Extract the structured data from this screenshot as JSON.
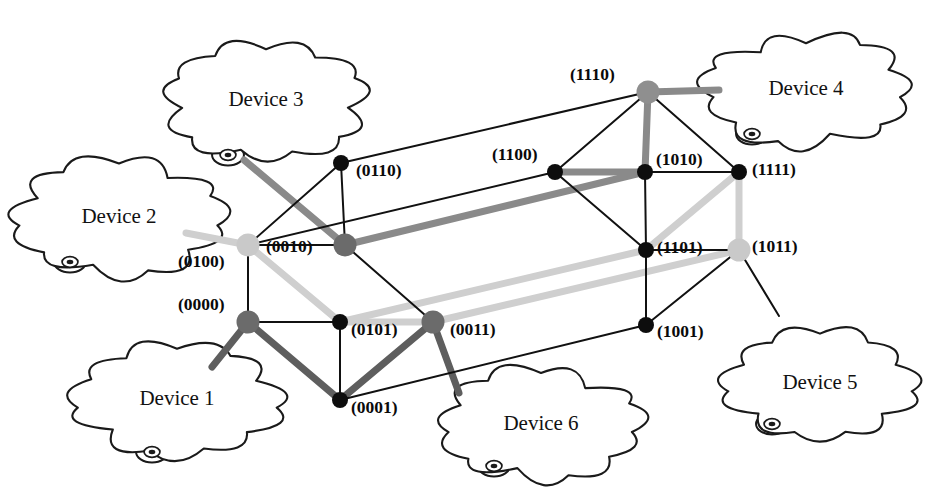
{
  "figure": {
    "width": 929,
    "height": 504,
    "background": "#ffffff"
  },
  "palette": {
    "thin_black": "#111111",
    "dark_gray": "#5e5e5e",
    "mid_gray": "#8a8a8a",
    "light_gray": "#cfcfcf",
    "node_black": "#0d0d0d",
    "text": "#0a0a0a"
  },
  "clouds": [
    {
      "id": "device-1",
      "label": "Device 1",
      "cx": 177,
      "cy": 400,
      "rx": 98,
      "ry": 52,
      "tail": {
        "x": 152,
        "y": 452,
        "r": 11
      }
    },
    {
      "id": "device-2",
      "label": "Device 2",
      "cx": 119,
      "cy": 218,
      "rx": 100,
      "ry": 53,
      "tail": {
        "x": 70,
        "y": 262,
        "r": 11
      }
    },
    {
      "id": "device-3",
      "label": "Device 3",
      "cx": 266,
      "cy": 101,
      "rx": 95,
      "ry": 54,
      "tail": {
        "x": 228,
        "y": 155,
        "r": 11
      }
    },
    {
      "id": "device-4",
      "label": "Device 4",
      "cx": 806,
      "cy": 90,
      "rx": 97,
      "ry": 52,
      "tail": {
        "x": 752,
        "y": 134,
        "r": 11
      }
    },
    {
      "id": "device-5",
      "label": "Device 5",
      "cx": 820,
      "cy": 384,
      "rx": 90,
      "ry": 50,
      "tail": {
        "x": 772,
        "y": 424,
        "r": 11
      }
    },
    {
      "id": "device-6",
      "label": "Device 6",
      "cx": 541,
      "cy": 425,
      "rx": 95,
      "ry": 51,
      "tail": {
        "x": 494,
        "y": 466,
        "r": 11
      }
    }
  ],
  "nodes": [
    {
      "id": "0110",
      "label": "(0110)",
      "x": 341,
      "y": 163,
      "style": "node-black",
      "r": 8,
      "lx": 356,
      "ly": 172
    },
    {
      "id": "1100",
      "label": "(1100)",
      "x": 555,
      "y": 172,
      "style": "node-black",
      "r": 8,
      "lx": 492,
      "ly": 156
    },
    {
      "id": "1110",
      "label": "(1110)",
      "x": 648,
      "y": 92,
      "style": "node-mid",
      "r": 11.5,
      "lx": 570,
      "ly": 76
    },
    {
      "id": "1010",
      "label": "(1010)",
      "x": 645,
      "y": 172,
      "style": "node-black",
      "r": 8,
      "lx": 656,
      "ly": 161
    },
    {
      "id": "1111",
      "label": "(1111)",
      "x": 739,
      "y": 172,
      "style": "node-black",
      "r": 8,
      "lx": 752,
      "ly": 171
    },
    {
      "id": "0100",
      "label": "(0100)",
      "x": 248,
      "y": 245,
      "style": "node-light",
      "r": 11.5,
      "lx": 178,
      "ly": 263
    },
    {
      "id": "0010",
      "label": "(0010)",
      "x": 345,
      "y": 245,
      "style": "node-dark",
      "r": 11.5,
      "lx": 266,
      "ly": 248
    },
    {
      "id": "1101",
      "label": "(1101)",
      "x": 646,
      "y": 250,
      "style": "node-black",
      "r": 8,
      "lx": 657,
      "ly": 249
    },
    {
      "id": "1011",
      "label": "(1011)",
      "x": 739,
      "y": 250,
      "style": "node-light",
      "r": 11.5,
      "lx": 752,
      "ly": 248
    },
    {
      "id": "0000",
      "label": "(0000)",
      "x": 248,
      "y": 322,
      "style": "node-dark",
      "r": 11.5,
      "lx": 178,
      "ly": 306
    },
    {
      "id": "0101",
      "label": "(0101)",
      "x": 340,
      "y": 322,
      "style": "node-black",
      "r": 8,
      "lx": 351,
      "ly": 331
    },
    {
      "id": "0011",
      "label": "(0011)",
      "x": 433,
      "y": 322,
      "style": "node-dark",
      "r": 11.5,
      "lx": 450,
      "ly": 331
    },
    {
      "id": "1001",
      "label": "(1001)",
      "x": 646,
      "y": 325,
      "style": "node-black",
      "r": 8,
      "lx": 657,
      "ly": 333
    },
    {
      "id": "0001",
      "label": "(0001)",
      "x": 340,
      "y": 400,
      "style": "node-black",
      "r": 8,
      "lx": 351,
      "ly": 409
    }
  ],
  "edges": [
    {
      "from": "0110",
      "to": "0010",
      "style": "edge-thin"
    },
    {
      "from": "0110",
      "to": "1110",
      "style": "edge-thin"
    },
    {
      "from": "0110",
      "to": "0100",
      "style": "edge-thin"
    },
    {
      "from": "0100",
      "to": "0010",
      "style": "edge-thin"
    },
    {
      "from": "0100",
      "to": "0000",
      "style": "edge-thin"
    },
    {
      "from": "0100",
      "to": "1100",
      "style": "edge-thin"
    },
    {
      "from": "0010",
      "to": "1010",
      "style": "edge-mid"
    },
    {
      "from": "0010",
      "to": "0011",
      "style": "edge-thin"
    },
    {
      "from": "0000",
      "to": "0101",
      "style": "edge-thin"
    },
    {
      "from": "0000",
      "to": "0001",
      "style": "edge-dark"
    },
    {
      "from": "0100",
      "to": "0101",
      "style": "edge-light"
    },
    {
      "from": "0101",
      "to": "0011",
      "style": "edge-light"
    },
    {
      "from": "0101",
      "to": "0001",
      "style": "edge-thin"
    },
    {
      "from": "0101",
      "to": "1101",
      "style": "edge-light"
    },
    {
      "from": "0011",
      "to": "0001",
      "style": "edge-dark"
    },
    {
      "from": "0011",
      "to": "1011",
      "style": "edge-light"
    },
    {
      "from": "0001",
      "to": "1001",
      "style": "edge-thin"
    },
    {
      "from": "1110",
      "to": "1100",
      "style": "edge-thin"
    },
    {
      "from": "1110",
      "to": "1010",
      "style": "edge-mid"
    },
    {
      "from": "1110",
      "to": "1111",
      "style": "edge-thin"
    },
    {
      "from": "1100",
      "to": "1010",
      "style": "edge-mid"
    },
    {
      "from": "1100",
      "to": "1101",
      "style": "edge-thin"
    },
    {
      "from": "1010",
      "to": "1111",
      "style": "edge-thin"
    },
    {
      "from": "1010",
      "to": "1101",
      "style": "edge-thin"
    },
    {
      "from": "1111",
      "to": "1011",
      "style": "edge-light"
    },
    {
      "from": "1111",
      "to": "1101",
      "style": "edge-light"
    },
    {
      "from": "1101",
      "to": "1011",
      "style": "edge-thin"
    },
    {
      "from": "1101",
      "to": "1001",
      "style": "edge-thin"
    },
    {
      "from": "1001",
      "to": "1011",
      "style": "edge-thin"
    }
  ],
  "device_links": [
    {
      "id": "link-device-1",
      "device": "device-1",
      "node": "0000",
      "style": "edge-dark",
      "x1": 212,
      "y1": 367,
      "x2": 248,
      "y2": 322
    },
    {
      "id": "link-device-2",
      "device": "device-2",
      "node": "0100",
      "style": "edge-light",
      "x1": 186,
      "y1": 233,
      "x2": 248,
      "y2": 245
    },
    {
      "id": "link-device-3",
      "device": "device-3",
      "node": "0010",
      "style": "edge-mid",
      "x1": 244,
      "y1": 160,
      "x2": 345,
      "y2": 245
    },
    {
      "id": "link-device-4",
      "device": "device-4",
      "node": "1110",
      "style": "edge-mid",
      "x1": 719,
      "y1": 90,
      "x2": 648,
      "y2": 92
    },
    {
      "id": "link-device-5",
      "device": "device-5",
      "node": "1011",
      "style": "edge-thin",
      "x1": 779,
      "y1": 316,
      "x2": 739,
      "y2": 250
    },
    {
      "id": "link-device-6",
      "device": "device-6",
      "node": "0011",
      "style": "edge-dark",
      "x1": 459,
      "y1": 393,
      "x2": 433,
      "y2": 322
    }
  ]
}
